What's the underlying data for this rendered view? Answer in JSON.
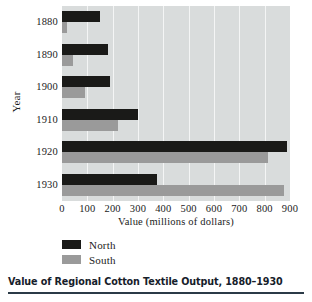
{
  "caption": "Value of Regional Cotton Textile Output, 1880–1930",
  "legend": {
    "north_label": "North",
    "south_label": "South"
  },
  "colors": {
    "north": "#1a1a18",
    "south": "#9a9a9a",
    "plot_background": "#d9dcdc",
    "gridline": "#f4f5f5"
  },
  "chart_data": {
    "type": "bar",
    "orientation": "horizontal",
    "title": "Value of Regional Cotton Textile Output, 1880–1930",
    "xlabel": "Value (millions of dollars)",
    "ylabel": "Year",
    "categories": [
      "1880",
      "1890",
      "1900",
      "1910",
      "1920",
      "1930"
    ],
    "series": [
      {
        "name": "North",
        "color": "#1a1a18",
        "values": [
          150,
          180,
          190,
          300,
          890,
          375
        ]
      },
      {
        "name": "South",
        "color": "#9a9a9a",
        "values": [
          20,
          45,
          90,
          220,
          815,
          875
        ]
      }
    ],
    "xlim": [
      0,
      900
    ],
    "xticks": [
      0,
      100,
      200,
      300,
      400,
      500,
      600,
      700,
      800,
      900
    ],
    "xtick_labels": [
      "0",
      "100",
      "200",
      "300",
      "400",
      "500",
      "600",
      "700",
      "800",
      "900"
    ],
    "grid": true,
    "grid_axis": "x",
    "legend_position": "below-axis-left"
  }
}
